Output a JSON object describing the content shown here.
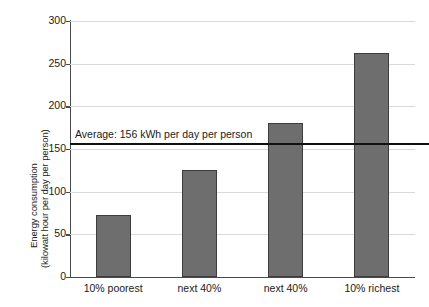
{
  "chart_data": {
    "type": "bar",
    "title": "",
    "xlabel": "",
    "ylabel": "Energy consumption (kilowatt hour per day per person)",
    "ylabel_line1": "Energy consumption",
    "ylabel_line2": "(kilowatt hour per day per person)",
    "categories": [
      "10% poorest",
      "next 40%",
      "next 40%",
      "10% richest"
    ],
    "values": [
      73,
      125,
      180,
      262
    ],
    "unit": "kWh per day per person",
    "ylim": [
      0,
      300
    ],
    "yticks": [
      0,
      50,
      100,
      150,
      200,
      250,
      300
    ],
    "ytick_labels": [
      "0",
      "50",
      "100",
      "150",
      "200",
      "250",
      "300"
    ],
    "grid": true,
    "grid_axis": "y",
    "legend": false,
    "bar_color": "#6e6e6e",
    "bar_edge_color": "#3d3d3d",
    "gridline_color": "#d9d9d9",
    "axis_color": "#4a4a4a",
    "annotations": [
      {
        "name": "average-line",
        "label": "Average: 156 kWh per day per person",
        "value": 156,
        "color": "#111111",
        "style": "horizontal-reference-line"
      }
    ]
  }
}
